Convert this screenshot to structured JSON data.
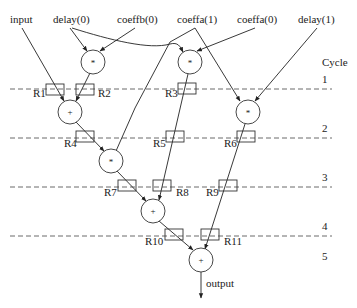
{
  "diagram": {
    "cycle_header": "Cycle",
    "cycles": [
      "1",
      "2",
      "3",
      "4",
      "5"
    ],
    "inputs": {
      "input": "input",
      "delay0": "delay(0)",
      "coeffb0": "coeffb(0)",
      "coeffa1": "coeffa(1)",
      "coeffa0": "coeffa(0)",
      "delay1": "delay(1)"
    },
    "output": "output",
    "operators": {
      "mul1": "*",
      "mul2": "*",
      "add1": "+",
      "mul3": "*",
      "mul4": "*",
      "add2": "+",
      "add3": "+"
    },
    "registers": [
      "R1",
      "R2",
      "R3",
      "R4",
      "R5",
      "R6",
      "R7",
      "R8",
      "R9",
      "R10",
      "R11"
    ]
  }
}
